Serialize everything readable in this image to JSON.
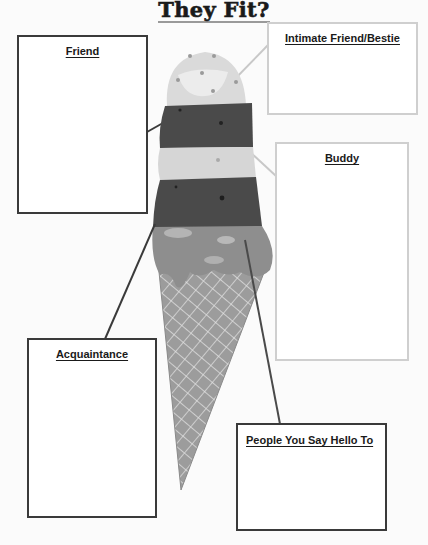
{
  "title": "They Fit?",
  "boxes": {
    "friend": {
      "label": "Friend"
    },
    "intimate": {
      "label": "Intimate Friend/Bestie"
    },
    "buddy": {
      "label": "Buddy"
    },
    "acquaintance": {
      "label": "Acquaintance"
    },
    "people": {
      "label": "People You Say Hello To"
    }
  },
  "colors": {
    "dark_border": "#3a3a3a",
    "light_border": "#cfcfcf",
    "scoop_dark": "#4a4a4a",
    "scoop_light": "#d6d6d6",
    "scoop_mid": "#8e8e8e",
    "cone": "#9c9c9c"
  }
}
